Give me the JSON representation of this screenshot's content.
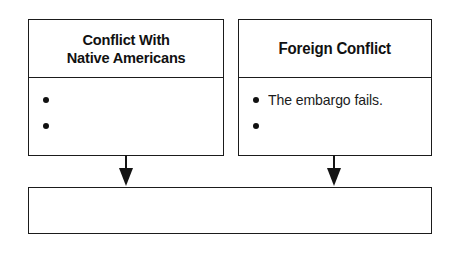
{
  "diagram": {
    "type": "cause-and-effect graphic organizer",
    "background_color": "#ffffff",
    "line_color": "#1b1b1b",
    "text_color": "#111111",
    "boxes": [
      {
        "id": "conflict-with-native-americans",
        "title": "Conflict With\nNative Americans",
        "bullets": [
          "",
          ""
        ]
      },
      {
        "id": "foreign-conflict",
        "title": "Foreign Conflict",
        "bullets": [
          "The embargo fails.",
          ""
        ]
      },
      {
        "id": "result-box",
        "title": "",
        "bullets": []
      }
    ],
    "arrows": [
      {
        "id": "arrow-from-native-americans",
        "direction": "down",
        "glyph": "down-arrow-icon"
      },
      {
        "id": "arrow-from-foreign-conflict",
        "direction": "down",
        "glyph": "down-arrow-icon"
      }
    ]
  }
}
